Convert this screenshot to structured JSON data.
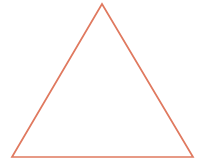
{
  "canvas": {
    "width": 223,
    "height": 160,
    "background_color": "#ffffff"
  },
  "figure": {
    "name": "triangle",
    "kind": "line-drawing",
    "stroke_color": "#e0795f",
    "fill_color": "none",
    "stroke_width": 1.7,
    "points": "102,4 193,157 12,157",
    "vertices": [
      {
        "label": "apex",
        "x": 102,
        "y": 4
      },
      {
        "label": "bottom-right",
        "x": 193,
        "y": 157
      },
      {
        "label": "bottom-left",
        "x": 12,
        "y": 157
      }
    ]
  }
}
